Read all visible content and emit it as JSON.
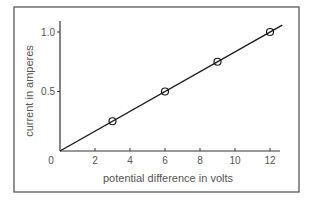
{
  "chart_data": {
    "type": "scatter",
    "title": "",
    "xlabel": "potential difference in volts",
    "ylabel": "current in amperes",
    "xlim": [
      0,
      12.7
    ],
    "ylim": [
      0,
      1.1
    ],
    "x_ticks": [
      2,
      4,
      6,
      8,
      10,
      12
    ],
    "x_tick_labels": [
      "2",
      "4",
      "6",
      "8",
      "10",
      "12"
    ],
    "y_ticks": [
      0.5,
      1.0
    ],
    "y_tick_labels": [
      "0.5",
      "1.0"
    ],
    "origin_label": "0",
    "grid": false,
    "legend": null,
    "series": [
      {
        "name": "measurements",
        "marker": "open-circle",
        "x": [
          3,
          6,
          9,
          12
        ],
        "y": [
          0.25,
          0.5,
          0.75,
          1.0
        ]
      }
    ],
    "fit_line": {
      "type": "linear",
      "through_origin": true,
      "slope": 0.0833,
      "x_range": [
        0,
        12.7
      ]
    }
  }
}
